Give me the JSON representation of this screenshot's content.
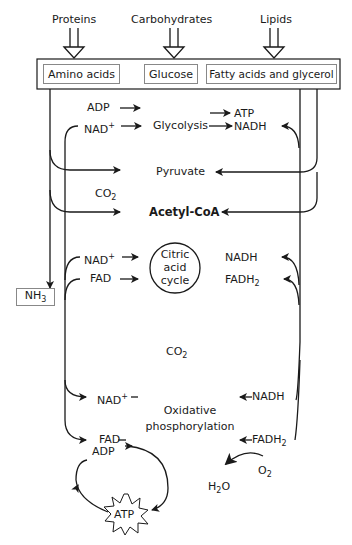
{
  "sources": {
    "proteins": "Proteins",
    "carbohydrates": "Carbohydrates",
    "lipids": "Lipids"
  },
  "monomers": {
    "amino_acids": "Amino acids",
    "glucose": "Glucose",
    "fatty_acids": "Fatty acids and glycerol"
  },
  "glycolysis": {
    "adp": "ADP",
    "nad": "NAD",
    "nad_sup": "+",
    "label": "Glycolysis",
    "atp": "ATP",
    "nadh": "NADH"
  },
  "pyruvate": "Pyruvate",
  "co2_1": {
    "base": "CO",
    "sub": "2"
  },
  "acetyl_coa": "Acetyl-CoA",
  "nh3": {
    "base": "NH",
    "sub": "3"
  },
  "citric": {
    "line1": "Citric",
    "line2": "acid",
    "line3": "cycle",
    "nad": "NAD",
    "nad_sup": "+",
    "fad": "FAD",
    "nadh": "NADH",
    "fadh": "FADH",
    "fadh_sub": "2"
  },
  "co2_2": {
    "base": "CO",
    "sub": "2"
  },
  "oxphos": {
    "line1": "Oxidative",
    "line2": "phosphorylation",
    "nad": "NAD",
    "nad_sup": "+",
    "fad": "FAD",
    "nadh": "NADH",
    "fadh": "FADH",
    "fadh_sub": "2"
  },
  "atp_cycle": {
    "adp": "ADP",
    "atp": "ATP"
  },
  "water": {
    "o2_base": "O",
    "o2_sub": "2",
    "h2o_h": "H",
    "h2o_sub": "2",
    "h2o_o": "O"
  }
}
